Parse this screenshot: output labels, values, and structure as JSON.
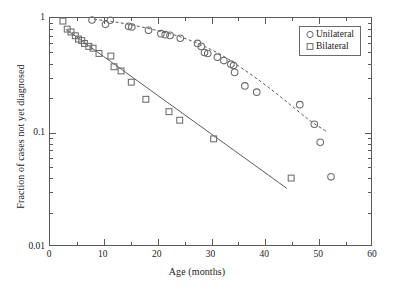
{
  "figure": {
    "background": "#ffffff",
    "line_color": "#5a5a5a",
    "marker_color": "#6b6b6b"
  },
  "chart_data": {
    "type": "scatter",
    "title": "",
    "xlabel": "Age (months)",
    "ylabel": "Fraction of cases not yet diagnosed",
    "xlim": [
      0,
      60
    ],
    "ylim": [
      0.01,
      1
    ],
    "yscale": "log",
    "xscale": "linear",
    "grid": false,
    "legend_position": "top-right",
    "xticks": [
      0,
      10,
      20,
      30,
      40,
      50,
      60
    ],
    "xtick_labels": [
      "0",
      "10",
      "20",
      "30",
      "40",
      "50",
      "60"
    ],
    "xminor_ticks": [
      5,
      15,
      25,
      35,
      45,
      55
    ],
    "yticks": [
      1,
      0.1,
      0.01
    ],
    "ytick_labels": [
      "1",
      "0.1",
      "0.01"
    ],
    "yminor_ticks": [
      0.9,
      0.8,
      0.7,
      0.6,
      0.5,
      0.4,
      0.3,
      0.2,
      0.09,
      0.08,
      0.07,
      0.06,
      0.05,
      0.04,
      0.03,
      0.02
    ],
    "series": [
      {
        "name": "Unilateral",
        "marker": "circle",
        "marker_size": 4.6,
        "color": "#6b6b6b",
        "points": [
          [
            7.8,
            0.96
          ],
          [
            10.3,
            0.88
          ],
          [
            11.2,
            0.955
          ],
          [
            14.6,
            0.845
          ],
          [
            15.2,
            0.835
          ],
          [
            18.3,
            0.78
          ],
          [
            20.6,
            0.73
          ],
          [
            21.4,
            0.715
          ],
          [
            22.3,
            0.705
          ],
          [
            24.2,
            0.665
          ],
          [
            27.4,
            0.6
          ],
          [
            28.1,
            0.565
          ],
          [
            28.7,
            0.5
          ],
          [
            29.3,
            0.49
          ],
          [
            31.1,
            0.455
          ],
          [
            32.3,
            0.425
          ],
          [
            33.6,
            0.395
          ],
          [
            34.1,
            0.385
          ],
          [
            34.3,
            0.335
          ],
          [
            36.2,
            0.255
          ],
          [
            38.4,
            0.225
          ],
          [
            46.4,
            0.175
          ],
          [
            49.1,
            0.118
          ],
          [
            50.2,
            0.082
          ],
          [
            52.2,
            0.041
          ]
        ],
        "fit": {
          "style": "dashed",
          "points": [
            [
              8.2,
              0.975
            ],
            [
              12,
              0.925
            ],
            [
              16,
              0.855
            ],
            [
              20,
              0.775
            ],
            [
              24,
              0.69
            ],
            [
              28,
              0.585
            ],
            [
              32,
              0.47
            ],
            [
              36,
              0.355
            ],
            [
              40,
              0.26
            ],
            [
              44,
              0.185
            ],
            [
              48,
              0.13
            ],
            [
              51.5,
              0.101
            ]
          ]
        }
      },
      {
        "name": "Bilateral",
        "marker": "square",
        "marker_size": 4.6,
        "color": "#6b6b6b",
        "points": [
          [
            2.4,
            0.94
          ],
          [
            3.2,
            0.8
          ],
          [
            3.9,
            0.755
          ],
          [
            4.7,
            0.7
          ],
          [
            5.3,
            0.655
          ],
          [
            5.9,
            0.635
          ],
          [
            6.4,
            0.6
          ],
          [
            7.2,
            0.565
          ],
          [
            8.0,
            0.545
          ],
          [
            9.1,
            0.49
          ],
          [
            11.3,
            0.465
          ],
          [
            11.9,
            0.375
          ],
          [
            13.2,
            0.345
          ],
          [
            15.1,
            0.275
          ],
          [
            17.8,
            0.195
          ],
          [
            22.1,
            0.152
          ],
          [
            24.1,
            0.128
          ],
          [
            30.4,
            0.088
          ],
          [
            44.8,
            0.04
          ]
        ],
        "fit": {
          "style": "solid",
          "points": [
            [
              2.9,
              0.8
            ],
            [
              44.0,
              0.0325
            ]
          ]
        }
      }
    ]
  },
  "legend": {
    "items": [
      {
        "label": "Unilateral",
        "marker": "circle-marker"
      },
      {
        "label": "Bilateral",
        "marker": "square-marker"
      }
    ]
  }
}
